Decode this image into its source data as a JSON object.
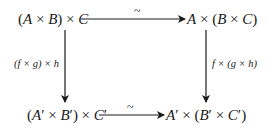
{
  "diagram": {
    "type": "commutative-square",
    "nodes": {
      "top_left": "(A × B) × C",
      "top_right": "A × (B × C)",
      "bottom_left": "(A′ × B′) × C′",
      "bottom_right": "A′ × (B′ × C′)"
    },
    "arrows": {
      "top": {
        "from": "top_left",
        "to": "top_right",
        "label": "~"
      },
      "bottom": {
        "from": "bottom_left",
        "to": "bottom_right",
        "label": "~"
      },
      "left": {
        "from": "top_left",
        "to": "bottom_left",
        "label": "(f × g) × h"
      },
      "right": {
        "from": "top_right",
        "to": "bottom_right",
        "label": "f × (g × h)"
      }
    },
    "colors": {
      "ink": "#1a1a1a",
      "background": "#ffffff"
    }
  }
}
